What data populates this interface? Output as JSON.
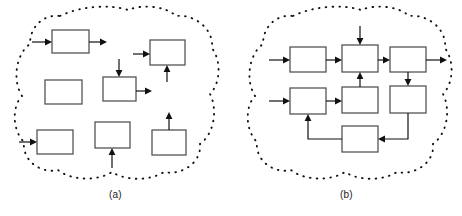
{
  "figure": {
    "width": 462,
    "height": 216,
    "background": "#ffffff",
    "line_color": "#111111",
    "box_stroke_color": "#555555",
    "box_fill_color": "#ffffff"
  },
  "panels": [
    {
      "id": "a",
      "caption": "(a)",
      "boundary": {
        "shape": "dotted-cloud",
        "stroke": "#111111",
        "dash": "dotted"
      },
      "blocks": [
        {
          "id": "a1",
          "x": 52,
          "y": 30,
          "w": 37,
          "h": 23
        },
        {
          "id": "a2",
          "x": 150,
          "y": 40,
          "w": 35,
          "h": 25
        },
        {
          "id": "a3",
          "x": 45,
          "y": 80,
          "w": 37,
          "h": 24
        },
        {
          "id": "a4",
          "x": 103,
          "y": 77,
          "w": 33,
          "h": 24
        },
        {
          "id": "a5",
          "x": 37,
          "y": 130,
          "w": 36,
          "h": 24
        },
        {
          "id": "a6",
          "x": 95,
          "y": 122,
          "w": 35,
          "h": 26
        },
        {
          "id": "a7",
          "x": 152,
          "y": 130,
          "w": 34,
          "h": 25
        }
      ],
      "arrows": [
        {
          "id": "a1-in",
          "from": "free",
          "to": "a1",
          "direction": "right"
        },
        {
          "id": "a1-out",
          "from": "a1",
          "to": "free",
          "direction": "right"
        },
        {
          "id": "a2-in",
          "from": "free",
          "to": "a2",
          "direction": "right"
        },
        {
          "id": "a2-in2",
          "from": "free",
          "to": "a2",
          "direction": "up"
        },
        {
          "id": "a4-in",
          "from": "free",
          "to": "a4",
          "direction": "down"
        },
        {
          "id": "a4-out",
          "from": "a4",
          "to": "free",
          "direction": "right"
        },
        {
          "id": "a5-in",
          "from": "free",
          "to": "a5",
          "direction": "right"
        },
        {
          "id": "a6-in",
          "from": "free",
          "to": "a6",
          "direction": "up"
        },
        {
          "id": "a7-out",
          "from": "a7",
          "to": "free",
          "direction": "up"
        }
      ]
    },
    {
      "id": "b",
      "caption": "(b)",
      "boundary": {
        "shape": "dotted-cloud",
        "stroke": "#111111",
        "dash": "dotted"
      },
      "blocks": [
        {
          "id": "b1",
          "x": 59,
          "y": 47,
          "w": 36,
          "h": 25
        },
        {
          "id": "b2",
          "x": 111,
          "y": 45,
          "w": 36,
          "h": 27
        },
        {
          "id": "b3",
          "x": 159,
          "y": 47,
          "w": 36,
          "h": 25
        },
        {
          "id": "b4",
          "x": 59,
          "y": 88,
          "w": 36,
          "h": 26
        },
        {
          "id": "b5",
          "x": 111,
          "y": 87,
          "w": 36,
          "h": 26
        },
        {
          "id": "b6",
          "x": 159,
          "y": 86,
          "w": 36,
          "h": 27
        },
        {
          "id": "b7",
          "x": 111,
          "y": 126,
          "w": 36,
          "h": 26
        }
      ],
      "connections": [
        {
          "id": "b-in-top",
          "from": "external",
          "to": "b1",
          "direction": "right"
        },
        {
          "id": "b1-b2",
          "from": "b1",
          "to": "b2",
          "direction": "right"
        },
        {
          "id": "b-in-b2-top",
          "from": "external",
          "to": "b2",
          "direction": "down"
        },
        {
          "id": "b2-b3",
          "from": "b2",
          "to": "b3",
          "direction": "right"
        },
        {
          "id": "b3-out",
          "from": "b3",
          "to": "external",
          "direction": "right"
        },
        {
          "id": "b-in-mid",
          "from": "external",
          "to": "b4",
          "direction": "right"
        },
        {
          "id": "b4-b5",
          "from": "b4",
          "to": "b5",
          "direction": "right"
        },
        {
          "id": "b5-b2",
          "from": "b5",
          "to": "b2",
          "direction": "up"
        },
        {
          "id": "b3-b6",
          "from": "b3",
          "to": "b6",
          "direction": "down"
        },
        {
          "id": "b6-b7",
          "from": "b6",
          "to": "b7",
          "direction": "left"
        },
        {
          "id": "b7-b4",
          "from": "b7",
          "to": "b4",
          "direction": "feedback-up-left"
        }
      ]
    }
  ]
}
